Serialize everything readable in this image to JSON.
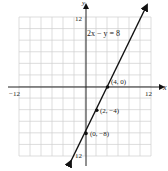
{
  "chart_data": {
    "type": "line",
    "title": "",
    "equation": "2x − y = 8",
    "xlabel": "x",
    "ylabel": "y",
    "xlim": [
      -12,
      12
    ],
    "ylim": [
      -12,
      12
    ],
    "grid": true,
    "grid_step": 2,
    "tick_labels": {
      "x_min": "−12",
      "x_max": "12",
      "y_max": "12",
      "y_min": "12"
    },
    "series": [
      {
        "name": "2x − y = 8",
        "slope": 2,
        "intercept": -8,
        "x": [
          -2,
          10
        ],
        "y": [
          -12,
          12
        ]
      }
    ],
    "points": [
      {
        "x": 4,
        "y": 0,
        "label": "(4, 0)"
      },
      {
        "x": 2,
        "y": -4,
        "label": "(2, −4)"
      },
      {
        "x": 0,
        "y": -8,
        "label": "(0, −8)"
      }
    ]
  }
}
